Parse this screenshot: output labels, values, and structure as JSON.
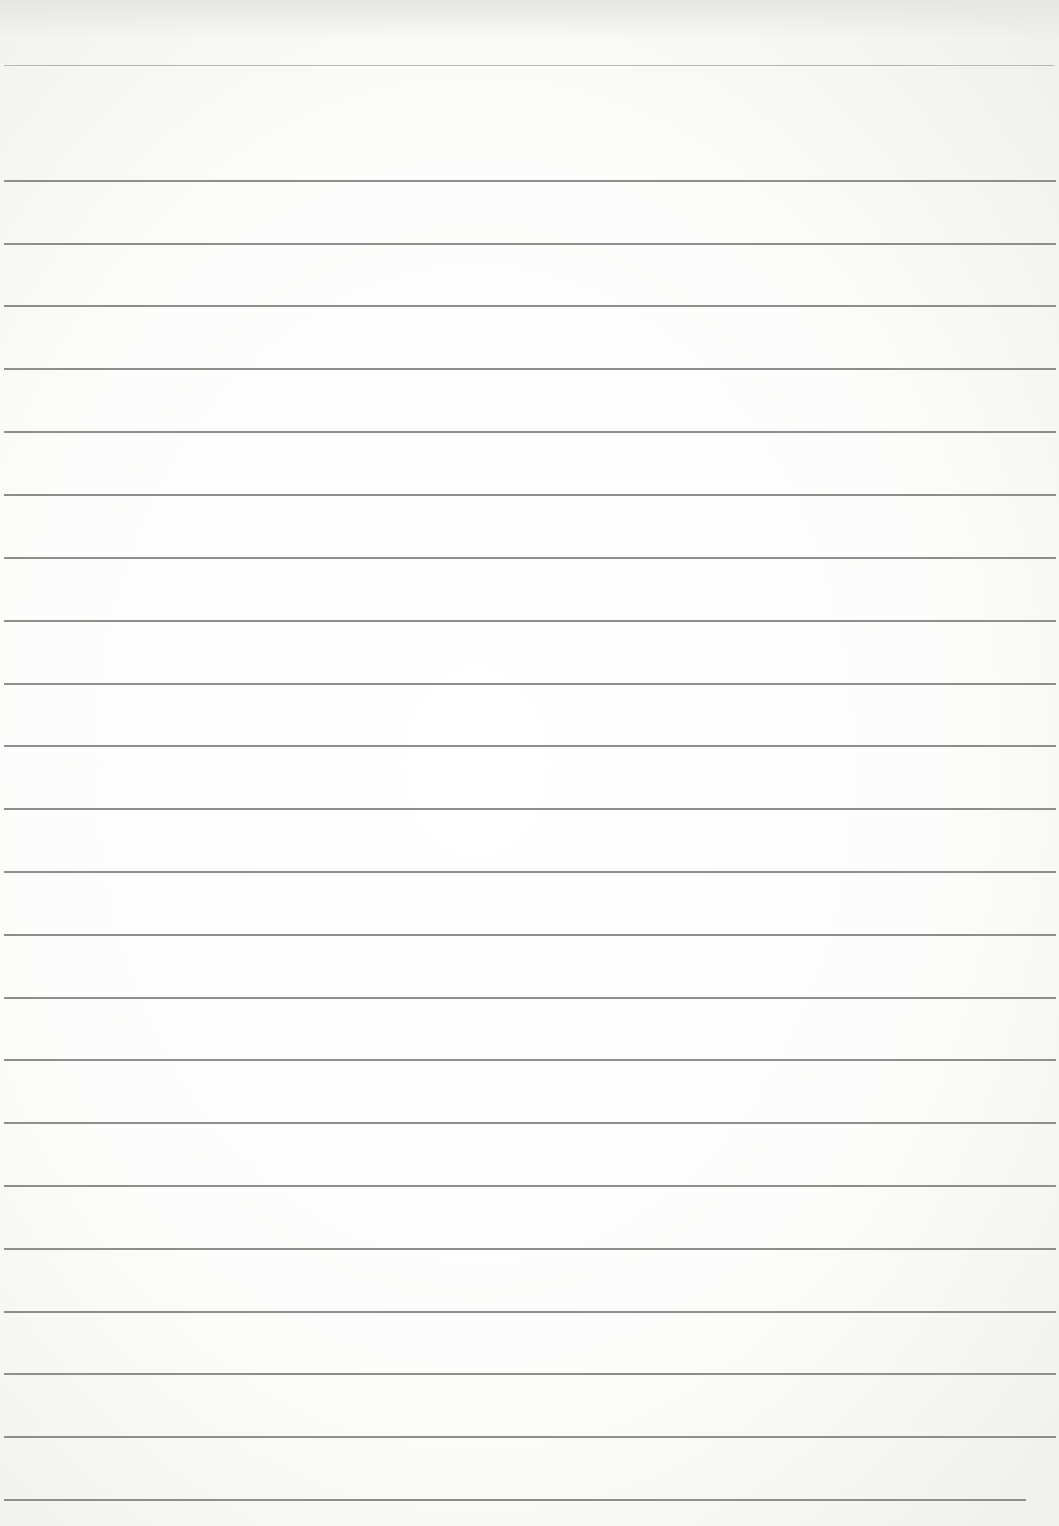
{
  "document": {
    "type": "blank lined paper",
    "header_rule_y": 65,
    "rule_color": "#8e8e8c",
    "rule_ys": [
      180,
      243,
      305,
      368,
      431,
      494,
      557,
      620,
      683,
      745,
      808,
      871,
      934,
      997,
      1059,
      1122,
      1185,
      1248,
      1311,
      1373,
      1436,
      1499
    ]
  }
}
